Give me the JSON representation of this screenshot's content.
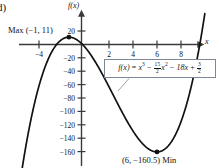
{
  "figure": {
    "part_letter": "d)",
    "axis_label_y": "f(x)",
    "axis_label_x": "x",
    "equation_display": "f(x) = x³ − (15/2)x² − 18x + 3/2",
    "equation_parts": {
      "lhs": "f(x)",
      "equals": "=",
      "term1_base": "x",
      "term1_exp": "3",
      "op1": "−",
      "term2_coef_num": "15",
      "term2_coef_den": "2",
      "term2_base": "x",
      "term2_exp": "2",
      "op2": "−",
      "term3": "18x",
      "op3": "+",
      "term4_num": "3",
      "term4_den": "2"
    },
    "max_annotation": "Max (−1, 11)",
    "min_annotation": "(6, −160.5) Min"
  },
  "chart_data": {
    "type": "line",
    "title": "",
    "xlabel": "x",
    "ylabel": "f(x)",
    "xlim": [
      -5.5,
      9.8
    ],
    "ylim": [
      -185,
      30
    ],
    "grid": false,
    "legend": "none",
    "function": "f(x) = x^3 - (15/2)x^2 - 18x + 3/2",
    "x_ticks": [
      -4,
      2,
      4,
      6,
      8
    ],
    "x_tick_labels": [
      "−4",
      "2",
      "4",
      "6",
      "8"
    ],
    "y_ticks": [
      20,
      -20,
      -40,
      -60,
      -80,
      -100,
      -120,
      -140,
      -160
    ],
    "y_tick_labels": [
      "20",
      "−20",
      "−40",
      "−60",
      "−80",
      "−100",
      "−120",
      "−140",
      "−160"
    ],
    "annotations": [
      {
        "label": "Max (−1, 11)",
        "x": -1,
        "y": 11,
        "kind": "maximum"
      },
      {
        "label": "(6, −160.5) Min",
        "x": 6,
        "y": -160.5,
        "kind": "minimum"
      }
    ],
    "marked_points": [
      {
        "x": -1,
        "y": 11
      },
      {
        "x": 6,
        "y": -160.5
      }
    ]
  }
}
